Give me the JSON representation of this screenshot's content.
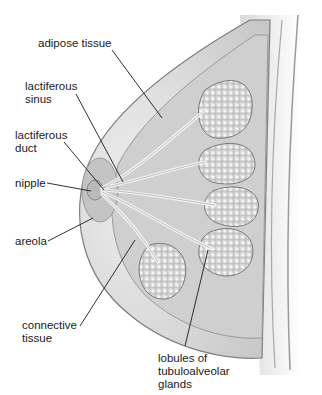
{
  "diagram": {
    "labels": [
      {
        "id": "adipose-tissue",
        "text": "adipose tissue",
        "x": 38,
        "y": 37
      },
      {
        "id": "lactiferous-sinus",
        "text": "lactiferous\nsinus",
        "x": 25,
        "y": 80
      },
      {
        "id": "lactiferous-duct",
        "text": "lactiferous\nduct",
        "x": 15,
        "y": 129
      },
      {
        "id": "nipple",
        "text": "nipple",
        "x": 15,
        "y": 177
      },
      {
        "id": "areola",
        "text": "areola",
        "x": 15,
        "y": 235
      },
      {
        "id": "connective-tissue",
        "text": "connective\ntissue",
        "x": 22,
        "y": 319
      },
      {
        "id": "lobules",
        "text": "lobules of\ntubuloalveolar\nglands",
        "x": 158,
        "y": 352
      }
    ],
    "colors": {
      "background": "#ffffff",
      "skin": "#e4e4e4",
      "adipose": "#cfcfcf",
      "lobule": "#dcdcdc",
      "duct": "#f2f2f2",
      "outline": "#8a8a8a",
      "leader": "#1a1a1a"
    }
  }
}
